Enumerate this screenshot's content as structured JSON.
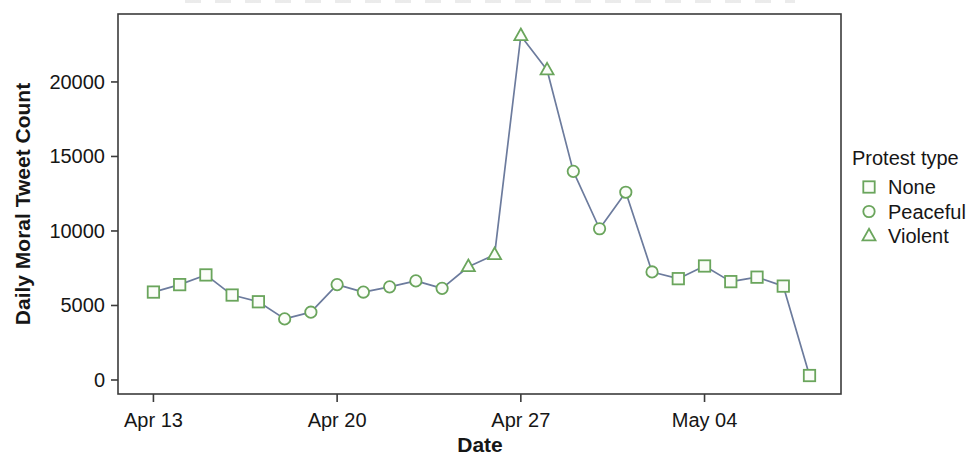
{
  "chart_data": {
    "type": "line",
    "title": "",
    "xlabel": "Date",
    "ylabel": "Daily Moral Tweet Count",
    "x_tick_labels": [
      "Apr 13",
      "Apr 20",
      "Apr 27",
      "May 04"
    ],
    "x_tick_days": [
      0,
      7,
      14,
      21
    ],
    "y_ticks": [
      0,
      5000,
      10000,
      15000,
      20000
    ],
    "x_range_days": [
      -1.35,
      26.2
    ],
    "ylim": [
      -940,
      24560
    ],
    "grid": false,
    "legend": {
      "title": "Protest type",
      "position": "right",
      "entries": [
        {
          "label": "None",
          "marker": "square"
        },
        {
          "label": "Peaceful",
          "marker": "circle"
        },
        {
          "label": "Violent",
          "marker": "triangle"
        }
      ]
    },
    "points": [
      {
        "date": "Apr 13",
        "day": 0,
        "value": 5900,
        "protest": "None"
      },
      {
        "date": "Apr 14",
        "day": 1,
        "value": 6400,
        "protest": "None"
      },
      {
        "date": "Apr 15",
        "day": 2,
        "value": 7050,
        "protest": "None"
      },
      {
        "date": "Apr 16",
        "day": 3,
        "value": 5700,
        "protest": "None"
      },
      {
        "date": "Apr 17",
        "day": 4,
        "value": 5250,
        "protest": "None"
      },
      {
        "date": "Apr 18",
        "day": 5,
        "value": 4100,
        "protest": "Peaceful"
      },
      {
        "date": "Apr 19",
        "day": 6,
        "value": 4550,
        "protest": "Peaceful"
      },
      {
        "date": "Apr 20",
        "day": 7,
        "value": 6400,
        "protest": "Peaceful"
      },
      {
        "date": "Apr 21",
        "day": 8,
        "value": 5900,
        "protest": "Peaceful"
      },
      {
        "date": "Apr 22",
        "day": 9,
        "value": 6250,
        "protest": "Peaceful"
      },
      {
        "date": "Apr 23",
        "day": 10,
        "value": 6650,
        "protest": "Peaceful"
      },
      {
        "date": "Apr 24",
        "day": 11,
        "value": 6150,
        "protest": "Peaceful"
      },
      {
        "date": "Apr 25",
        "day": 12,
        "value": 7600,
        "protest": "Violent"
      },
      {
        "date": "Apr 26",
        "day": 13,
        "value": 8400,
        "protest": "Violent"
      },
      {
        "date": "Apr 27",
        "day": 14,
        "value": 23100,
        "protest": "Violent"
      },
      {
        "date": "Apr 28",
        "day": 15,
        "value": 20800,
        "protest": "Violent"
      },
      {
        "date": "Apr 29",
        "day": 16,
        "value": 14000,
        "protest": "Peaceful"
      },
      {
        "date": "Apr 30",
        "day": 17,
        "value": 10150,
        "protest": "Peaceful"
      },
      {
        "date": "May 01",
        "day": 18,
        "value": 12600,
        "protest": "Peaceful"
      },
      {
        "date": "May 02",
        "day": 19,
        "value": 7250,
        "protest": "Peaceful"
      },
      {
        "date": "May 03",
        "day": 20,
        "value": 6800,
        "protest": "None"
      },
      {
        "date": "May 04",
        "day": 21,
        "value": 7650,
        "protest": "None"
      },
      {
        "date": "May 05",
        "day": 22,
        "value": 6600,
        "protest": "None"
      },
      {
        "date": "May 06",
        "day": 23,
        "value": 6900,
        "protest": "None"
      },
      {
        "date": "May 07",
        "day": 24,
        "value": 6300,
        "protest": "None"
      },
      {
        "date": "May 08",
        "day": 25,
        "value": 300,
        "protest": "None"
      }
    ],
    "colors": {
      "line": "#6c7b9d",
      "marker_stroke": "#6aa55c",
      "marker_fill": "#fbfdf9",
      "axis": "#3b3b3b",
      "text": "#161616"
    }
  }
}
